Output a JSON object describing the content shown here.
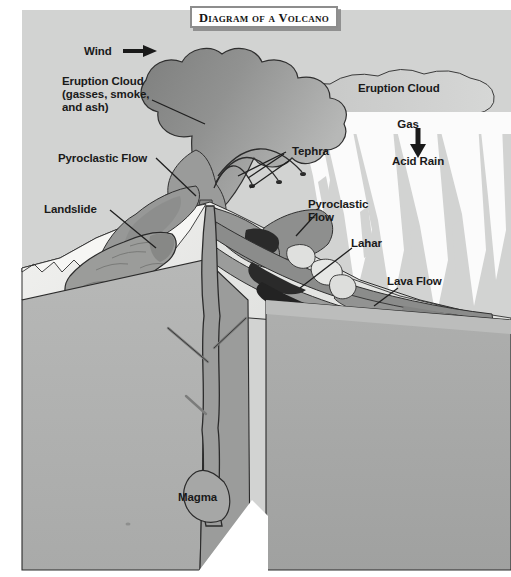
{
  "title": {
    "text": "Diagram of a Volcano"
  },
  "diagram": {
    "subject": "volcano",
    "view": "3D block cutaway cross-section"
  },
  "labels": [
    {
      "id": "wind",
      "text": "Wind",
      "x": 84,
      "y": 45,
      "align": "left",
      "icon": "arrow-right-icon"
    },
    {
      "id": "eruption-cloud-l",
      "text": "Eruption Cloud\n(gasses, smoke,\nand ash)",
      "x": 62,
      "y": 75,
      "align": "left"
    },
    {
      "id": "eruption-cloud-r",
      "text": "Eruption Cloud",
      "x": 358,
      "y": 82,
      "align": "left"
    },
    {
      "id": "pyroclastic-l",
      "text": "Pyroclastic Flow",
      "x": 58,
      "y": 152,
      "align": "left"
    },
    {
      "id": "tephra",
      "text": "Tephra",
      "x": 292,
      "y": 145,
      "align": "left"
    },
    {
      "id": "gas",
      "text": "Gas",
      "x": 408,
      "y": 118,
      "align": "center",
      "icon": "arrow-down-icon"
    },
    {
      "id": "acid-rain",
      "text": "Acid Rain",
      "x": 392,
      "y": 155,
      "align": "left"
    },
    {
      "id": "landslide",
      "text": "Landslide",
      "x": 44,
      "y": 203,
      "align": "left"
    },
    {
      "id": "pyroclastic-r",
      "text": "Pyroclastic\nFlow",
      "x": 308,
      "y": 198,
      "align": "left"
    },
    {
      "id": "lahar",
      "text": "Lahar",
      "x": 351,
      "y": 237,
      "align": "left"
    },
    {
      "id": "lava-flow",
      "text": "Lava Flow",
      "x": 387,
      "y": 275,
      "align": "left"
    },
    {
      "id": "magma",
      "text": "Magma",
      "x": 178,
      "y": 491,
      "align": "left"
    }
  ],
  "colors": {
    "sky": "#d2d3d2",
    "cloud_dark": "#8e8f8e",
    "cloud_mid": "#a5a6a5",
    "cloud_light": "#c0c1c0",
    "acid_rain": "#fbfbfb",
    "block_left": "#b3b4b3",
    "block_right": "#a8a9a8",
    "block_top": "#c6c7c6",
    "ground_white": "#f4f4f2",
    "flow_dark": "#8b8c8b",
    "flow_mid": "#9a9b9a",
    "lava_black": "#2a2a2a",
    "landslide": "#9c9d9b",
    "outline": "#2b2b2b",
    "label_text": "#1a1a1a",
    "title_border": "#8d8d8d"
  }
}
